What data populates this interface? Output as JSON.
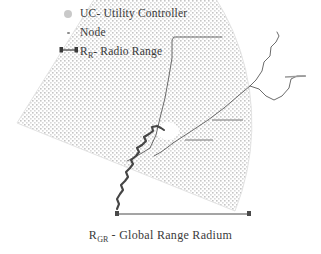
{
  "figure": {
    "background_color": "#ffffff",
    "ink_color": "#3a3a3a"
  },
  "legend": {
    "items": [
      {
        "marker": "uc-disc",
        "marker_color": "#c9c9c9",
        "label": "UC- Utility Controller"
      },
      {
        "marker": "node-dot",
        "marker_color": "#8d8d8d",
        "label": "Node"
      },
      {
        "marker": "radio-range-bar",
        "marker_color": "#3a3a3a",
        "label_prefix": "R",
        "label_sub": "R",
        "label_suffix": "- Radio Range"
      }
    ]
  },
  "caption": {
    "prefix": "R",
    "sub": "GR",
    "suffix": " - Global Range Radium"
  },
  "sector": {
    "fill_pattern": "cross-hatch-dots",
    "fill_color": "#d0d0d0",
    "apex_x": 17,
    "apex_y": 123,
    "radius": 235,
    "start_angle_deg": -58,
    "end_angle_deg": 22
  },
  "dimension_line": {
    "x1": 117,
    "x2": 250,
    "y": 214,
    "color": "#4a4a4a",
    "endcaps": "square-tick"
  },
  "uc_blob": {
    "cx": 168,
    "cy": 131,
    "rx": 11,
    "ry": 9,
    "color": "#ffffff"
  },
  "network": {
    "line_color": "#5a5a5a",
    "thick_line_color": "#444444",
    "branches": [
      "trunk-up-left",
      "trunk-diagonal-right",
      "spur-upper-right",
      "spur-far-right",
      "leader-stub-upper",
      "leader-stub-lower"
    ]
  }
}
